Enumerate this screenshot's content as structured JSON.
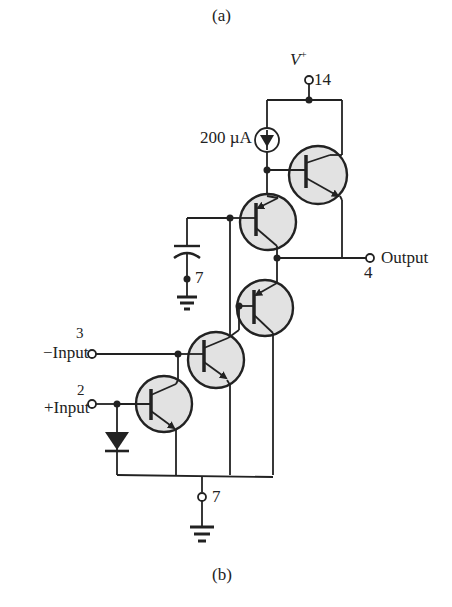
{
  "figure": {
    "top_caption": "(a)",
    "bottom_caption": "(b)"
  },
  "supply": {
    "label": "V",
    "label_superscript": "+",
    "pin": "14"
  },
  "current_source": {
    "label": "200 µA"
  },
  "output": {
    "label": "Output",
    "pin": "4"
  },
  "inputs": [
    {
      "label": "−Input",
      "pin": "3"
    },
    {
      "label": "+Input",
      "pin": "2"
    }
  ],
  "ground_pins": {
    "capacitor_node": "7",
    "bottom_node": "7"
  },
  "components": {
    "transistors": [
      {
        "id": "Q-top-right",
        "type": "NPN"
      },
      {
        "id": "Q-upper-mid",
        "type": "PNP"
      },
      {
        "id": "Q-mid",
        "type": "PNP"
      },
      {
        "id": "Q-lower-mid",
        "type": "NPN"
      },
      {
        "id": "Q-bottom-left",
        "type": "NPN"
      }
    ],
    "capacitor": 1,
    "diode": 1,
    "current_sources": 1,
    "grounds": 2
  },
  "colors": {
    "line": "#222222",
    "transistor_fill": "#e2e2e2",
    "background": "#ffffff"
  }
}
